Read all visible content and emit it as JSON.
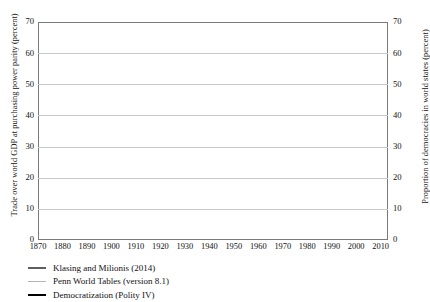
{
  "chart_data": {
    "type": "line",
    "title": "",
    "xlabel": "",
    "ylabel": "Trade over world GDP at purchasing power parity (percent)",
    "ylabel_right": "Proportion of democracies in world states (percent)",
    "xlim": [
      1870,
      2013
    ],
    "ylim": [
      0,
      70
    ],
    "ylim_right": [
      0,
      70
    ],
    "grid": true,
    "legend_position": "below-left",
    "xticks": [
      1870,
      1880,
      1890,
      1900,
      1910,
      1920,
      1930,
      1940,
      1950,
      1960,
      1970,
      1980,
      1990,
      2000,
      2010
    ],
    "yticks": [
      0,
      10,
      20,
      30,
      40,
      50,
      60,
      70
    ],
    "yticks_right": [
      0,
      10,
      20,
      30,
      40,
      50,
      60,
      70
    ],
    "colors": {
      "klasing": "#5e5e5e",
      "penn": "#b4b4b4",
      "democratization": "#000000",
      "grid": "#c9c9c9",
      "frame": "#7a7a7a"
    },
    "series": [
      {
        "name": "Klasing and Milionis (2014)",
        "axis": "left",
        "color": "#5e5e5e",
        "x": [
          1870,
          1871,
          1872,
          1873,
          1874,
          1875,
          1876,
          1877,
          1878,
          1879,
          1880,
          1881,
          1882,
          1883,
          1884,
          1885,
          1886,
          1887,
          1888,
          1889,
          1890,
          1891,
          1892,
          1893,
          1894,
          1895,
          1896,
          1897,
          1898,
          1899,
          1900,
          1901,
          1902,
          1903,
          1904,
          1905,
          1906,
          1907,
          1908,
          1909,
          1910,
          1911,
          1912,
          1913,
          1914,
          1915,
          1916,
          1917,
          1918,
          1919,
          1920,
          1921,
          1922,
          1923,
          1924,
          1925,
          1926,
          1927,
          1928,
          1929,
          1930,
          1931,
          1932,
          1933,
          1934,
          1935,
          1936,
          1937,
          1938,
          1939,
          1940,
          1941,
          1942,
          1943,
          1944,
          1945,
          1946,
          1947,
          1948,
          1949
        ],
        "values": [
          17.2,
          18.4,
          19.6,
          20.6,
          21.3,
          21.6,
          21.5,
          21.8,
          22.2,
          22.6,
          23.2,
          23.3,
          23.5,
          23.5,
          23.2,
          22.9,
          23.0,
          23.2,
          23.6,
          23.9,
          24.2,
          24.0,
          23.6,
          23.3,
          23.1,
          23.4,
          23.8,
          23.9,
          23.7,
          23.6,
          23.9,
          23.8,
          23.6,
          23.7,
          23.8,
          24.2,
          24.6,
          24.7,
          24.1,
          23.9,
          24.3,
          24.8,
          25.3,
          25.9,
          24.0,
          21.0,
          20.2,
          18.5,
          16.5,
          18.6,
          20.3,
          18.4,
          19.3,
          20.0,
          21.0,
          21.6,
          21.4,
          21.9,
          22.1,
          22.2,
          20.1,
          17.3,
          15.1,
          14.3,
          14.4,
          14.6,
          14.4,
          15.3,
          14.3,
          13.2,
          11.9,
          11.5,
          10.4,
          9.8,
          9.2,
          9.6,
          13.0,
          14.2,
          14.4,
          14.8
        ]
      },
      {
        "name": "Penn World Tables (version 8.1)",
        "axis": "left",
        "color": "#b4b4b4",
        "x": [
          1950,
          1951,
          1952,
          1953,
          1954,
          1955,
          1956,
          1957,
          1958,
          1959,
          1960,
          1961,
          1962,
          1963,
          1964,
          1965,
          1966,
          1967,
          1968,
          1969,
          1970,
          1971,
          1972,
          1973,
          1974,
          1975,
          1976,
          1977,
          1978,
          1979,
          1980,
          1981,
          1982,
          1983,
          1984,
          1985,
          1986,
          1987,
          1988,
          1989,
          1990,
          1991,
          1992,
          1993,
          1994,
          1995,
          1996,
          1997,
          1998,
          1999,
          2000,
          2001,
          2002,
          2003,
          2004,
          2005,
          2006,
          2007,
          2008,
          2009,
          2010,
          2011,
          2012,
          2013
        ],
        "values": [
          19.1,
          20.5,
          20.3,
          20.2,
          20.8,
          21.3,
          21.8,
          22.0,
          21.6,
          22.3,
          23.0,
          23.2,
          23.5,
          23.9,
          24.4,
          24.6,
          24.9,
          24.8,
          25.6,
          26.3,
          27.0,
          27.2,
          28.0,
          30.3,
          34.0,
          32.6,
          33.7,
          34.0,
          33.6,
          35.6,
          37.6,
          36.9,
          35.4,
          34.8,
          35.8,
          35.5,
          33.9,
          35.3,
          36.6,
          37.4,
          38.2,
          38.3,
          38.7,
          39.0,
          40.8,
          43.0,
          43.6,
          45.0,
          44.6,
          44.9,
          47.8,
          46.4,
          46.3,
          47.3,
          49.9,
          52.0,
          54.5,
          56.0,
          59.2,
          50.6,
          55.8,
          57.6,
          57.3,
          58.0
        ]
      },
      {
        "name": "Democratization (Polity IV)",
        "axis": "right",
        "color": "#000000",
        "x": [
          1870,
          1871,
          1872,
          1873,
          1874,
          1875,
          1876,
          1877,
          1878,
          1879,
          1880,
          1881,
          1882,
          1883,
          1884,
          1885,
          1886,
          1887,
          1888,
          1889,
          1890,
          1891,
          1892,
          1893,
          1894,
          1895,
          1896,
          1897,
          1898,
          1899,
          1900,
          1901,
          1902,
          1903,
          1904,
          1905,
          1906,
          1907,
          1908,
          1909,
          1910,
          1911,
          1912,
          1913,
          1914,
          1915,
          1916,
          1917,
          1918,
          1919,
          1920,
          1921,
          1922,
          1923,
          1924,
          1925,
          1926,
          1927,
          1928,
          1929,
          1930,
          1931,
          1932,
          1933,
          1934,
          1935,
          1936,
          1937,
          1938,
          1939,
          1940,
          1941,
          1942,
          1943,
          1944,
          1945,
          1946,
          1947,
          1948,
          1949,
          1950,
          1951,
          1952,
          1953,
          1954,
          1955,
          1956,
          1957,
          1958,
          1959,
          1960,
          1961,
          1962,
          1963,
          1964,
          1965,
          1966,
          1967,
          1968,
          1969,
          1970,
          1971,
          1972,
          1973,
          1974,
          1975,
          1976,
          1977,
          1978,
          1979,
          1980,
          1981,
          1982,
          1983,
          1984,
          1985,
          1986,
          1987,
          1988,
          1989,
          1990,
          1991,
          1992,
          1993,
          1994,
          1995,
          1996,
          1997,
          1998,
          1999,
          2000,
          2001,
          2002,
          2003,
          2004,
          2005,
          2006,
          2007,
          2008,
          2009,
          2010,
          2011,
          2012,
          2013
        ],
        "values": [
          9.8,
          10.2,
          10.4,
          10.6,
          11.0,
          11.2,
          11.6,
          11.4,
          11.2,
          11.8,
          13.6,
          13.8,
          13.4,
          13.2,
          13.4,
          13.8,
          14.4,
          14.2,
          14.0,
          13.8,
          14.2,
          14.6,
          14.8,
          15.6,
          14.8,
          14.0,
          13.2,
          14.0,
          14.6,
          14.8,
          15.0,
          15.2,
          15.6,
          15.8,
          16.0,
          16.2,
          16.6,
          16.8,
          16.6,
          16.8,
          17.0,
          17.4,
          17.6,
          18.0,
          18.2,
          18.0,
          17.8,
          18.4,
          20.6,
          26.5,
          31.0,
          33.6,
          34.8,
          34.4,
          35.6,
          37.8,
          36.6,
          35.2,
          34.6,
          34.0,
          33.0,
          32.4,
          31.0,
          28.6,
          28.0,
          27.0,
          26.2,
          26.0,
          26.0,
          25.2,
          22.0,
          18.0,
          14.0,
          12.6,
          12.4,
          16.0,
          22.0,
          23.2,
          24.0,
          23.2,
          24.0,
          24.5,
          25.8,
          26.2,
          26.5,
          28.2,
          28.6,
          29.0,
          28.0,
          27.6,
          28.0,
          27.2,
          26.2,
          26.4,
          26.0,
          27.2,
          27.4,
          26.8,
          26.0,
          25.6,
          25.2,
          24.8,
          24.2,
          24.6,
          26.0,
          26.4,
          26.8,
          27.4,
          28.0,
          29.2,
          29.8,
          30.0,
          30.8,
          31.2,
          31.8,
          33.0,
          33.8,
          34.6,
          36.0,
          38.0,
          40.6,
          42.6,
          44.6,
          45.0,
          44.6,
          46.0,
          47.0,
          48.0,
          49.2,
          50.0,
          51.0,
          51.6,
          52.4,
          53.2,
          54.0,
          55.0,
          56.0,
          56.2,
          53.0,
          57.0,
          57.5,
          55.6,
          57.0,
          57.8
        ]
      }
    ]
  },
  "axes": {
    "left_title": "Trade over world GDP at purchasing power parity (percent)",
    "right_title": "Proportion of democracies in world states (percent)"
  },
  "legend": {
    "items": [
      {
        "label": "Klasing and Milionis (2014)",
        "key": "klasing"
      },
      {
        "label": "Penn World Tables (version 8.1)",
        "key": "penn"
      },
      {
        "label": "Democratization (Polity IV)",
        "key": "demo"
      }
    ]
  }
}
